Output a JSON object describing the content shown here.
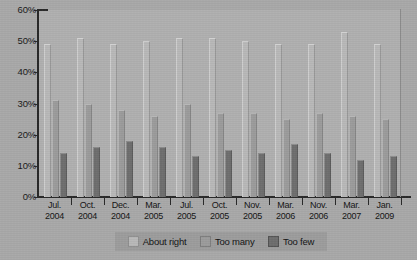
{
  "chart_data": {
    "type": "bar",
    "title": "",
    "xlabel": "",
    "ylabel": "",
    "ylim": [
      0,
      60
    ],
    "grid": false,
    "legend_position": "bottom",
    "ytick_labels": [
      "60%",
      "50%",
      "40%",
      "30%",
      "20%",
      "10%",
      "0%"
    ],
    "ytick_values": [
      60,
      50,
      40,
      30,
      20,
      10,
      0
    ],
    "categories": [
      "Jul. 2004",
      "Oct. 2004",
      "Dec. 2004",
      "Mar. 2005",
      "Jul. 2005",
      "Oct. 2005",
      "Nov. 2005",
      "Mar. 2006",
      "Nov. 2006",
      "Mar. 2007",
      "Jan. 2009"
    ],
    "category_lines": [
      {
        "l1": "Jul.",
        "l2": "2004"
      },
      {
        "l1": "Oct.",
        "l2": "2004"
      },
      {
        "l1": "Dec.",
        "l2": "2004"
      },
      {
        "l1": "Mar.",
        "l2": "2005"
      },
      {
        "l1": "Jul.",
        "l2": "2005"
      },
      {
        "l1": "Oct.",
        "l2": "2005"
      },
      {
        "l1": "Nov.",
        "l2": "2005"
      },
      {
        "l1": "Mar.",
        "l2": "2006"
      },
      {
        "l1": "Nov.",
        "l2": "2006"
      },
      {
        "l1": "Mar.",
        "l2": "2007"
      },
      {
        "l1": "Jan.",
        "l2": "2009"
      }
    ],
    "series": [
      {
        "name": "About right",
        "color": "#b9b9b9",
        "values": [
          49,
          51,
          49,
          50,
          51,
          51,
          50,
          49,
          49,
          53,
          49
        ]
      },
      {
        "name": "Too many",
        "color": "#9c9c9c",
        "values": [
          31,
          30,
          28,
          26,
          30,
          27,
          27,
          25,
          27,
          26,
          25
        ]
      },
      {
        "name": "Too few",
        "color": "#6f6f6f",
        "values": [
          14,
          16,
          18,
          16,
          13,
          15,
          14,
          17,
          14,
          12,
          13
        ]
      }
    ]
  },
  "legend": {
    "items": [
      {
        "label": "About right",
        "key": "about"
      },
      {
        "label": "Too many",
        "key": "many"
      },
      {
        "label": "Too few",
        "key": "few"
      }
    ]
  }
}
